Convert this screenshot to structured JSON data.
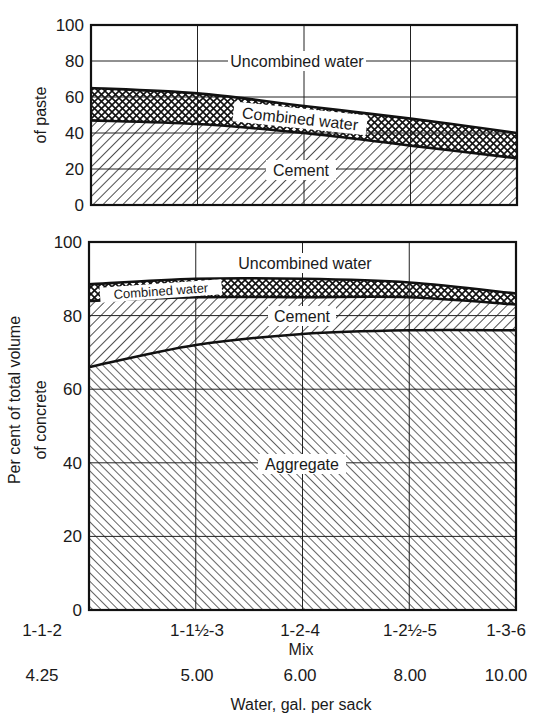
{
  "chart_data": [
    {
      "type": "area",
      "stacked": true,
      "title": "Per cent of total volume of paste",
      "ylabel": "Per cent of total volume of paste",
      "xlabel": "Mix",
      "ylim": [
        0,
        100
      ],
      "yticks": [
        "0",
        "20",
        "40",
        "60",
        "80",
        "100"
      ],
      "categories": [
        "1-1-2",
        "1-1½-3",
        "1-2-4",
        "1-2½-5",
        "1-3-6"
      ],
      "series": [
        {
          "name": "Cement",
          "values": [
            47,
            45,
            40,
            33,
            26
          ],
          "pattern": "diagonal-hatch-backslash"
        },
        {
          "name": "Combined water",
          "values": [
            18,
            17,
            15,
            15,
            14
          ],
          "pattern": "crosshatch"
        },
        {
          "name": "Uncombined water",
          "values": [
            35,
            38,
            45,
            52,
            60
          ],
          "pattern": "blank"
        }
      ],
      "boundaries": {
        "cement_top": [
          47,
          45,
          40,
          33,
          26
        ],
        "combined_water_top": [
          65,
          62,
          55,
          48,
          40
        ]
      },
      "grid": true
    },
    {
      "type": "area",
      "stacked": true,
      "title": "Per cent of total volume of concrete",
      "ylabel": "Per cent of total volume of concrete",
      "xlabel": "Mix",
      "ylim": [
        0,
        100
      ],
      "yticks": [
        "0",
        "20",
        "40",
        "60",
        "80",
        "100"
      ],
      "categories": [
        "1-1-2",
        "1-1½-3",
        "1-2-4",
        "1-2½-5",
        "1-3-6"
      ],
      "series": [
        {
          "name": "Aggregate",
          "values": [
            66,
            72,
            75,
            76,
            76
          ],
          "pattern": "diagonal-hatch-slash"
        },
        {
          "name": "Cement",
          "values": [
            18,
            13,
            10,
            9,
            7
          ],
          "pattern": "diagonal-hatch-backslash"
        },
        {
          "name": "Combined water",
          "values": [
            4.5,
            5,
            5,
            4,
            3
          ],
          "pattern": "crosshatch"
        },
        {
          "name": "Uncombined water",
          "values": [
            11.5,
            10,
            10,
            11,
            14
          ],
          "pattern": "blank"
        }
      ],
      "boundaries": {
        "aggregate_top": [
          66,
          72,
          75,
          76,
          76
        ],
        "cement_top": [
          84,
          85,
          85,
          85,
          83
        ],
        "combined_water_top": [
          88.5,
          90,
          90,
          89,
          86
        ]
      },
      "grid": true
    }
  ],
  "axes": {
    "shared_ylabel": "Per cent of total volume",
    "top_ylabel_sub": "of paste",
    "bottom_ylabel_sub": "of concrete",
    "yticks": [
      "0",
      "20",
      "40",
      "60",
      "80",
      "100"
    ],
    "mix_labels": [
      "1-1-2",
      "1-1½-3",
      "1-2-4",
      "1-2½-5",
      "1-3-6"
    ],
    "mix_title": "Mix",
    "water_labels": [
      "4.25",
      "5.00",
      "6.00",
      "8.00",
      "10.00"
    ],
    "water_title": "Water, gal. per sack"
  },
  "labels": {
    "top_uncombined": "Uncombined water",
    "top_combined": "Combined water",
    "top_cement": "Cement",
    "bottom_uncombined": "Uncombined water",
    "bottom_combined": "Combined water",
    "bottom_cement": "Cement",
    "bottom_aggregate": "Aggregate"
  },
  "colors": {
    "ink": "#1a1a1a",
    "paper": "#ffffff"
  }
}
